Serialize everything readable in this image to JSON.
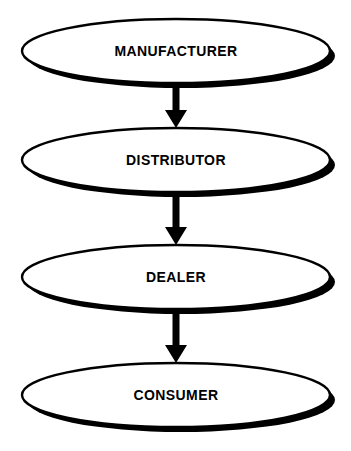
{
  "diagram": {
    "type": "flowchart",
    "orientation": "vertical-top-down",
    "background_color": "#ffffff",
    "shape_fill_color": "#ffffff",
    "shape_outline_color": "#000000",
    "shadow_color": "#000000",
    "text_color": "#000000",
    "nodes": [
      {
        "id": "manufacturer",
        "label": "MANUFACTURER",
        "shape": "ellipse",
        "cx": 176,
        "cy": 51,
        "rx": 154,
        "ry": 32
      },
      {
        "id": "distributor",
        "label": "DISTRIBUTOR",
        "shape": "ellipse",
        "cx": 176,
        "cy": 160,
        "rx": 154,
        "ry": 32
      },
      {
        "id": "dealer",
        "label": "DEALER",
        "shape": "ellipse",
        "cx": 176,
        "cy": 277,
        "rx": 154,
        "ry": 32
      },
      {
        "id": "consumer",
        "label": "CONSUMER",
        "shape": "ellipse",
        "cx": 176,
        "cy": 395,
        "rx": 154,
        "ry": 32
      }
    ],
    "connectors": [
      {
        "id": "manufacturer-to-distributor",
        "from": "manufacturer",
        "to": "distributor",
        "style": "solid-block-arrow",
        "direction": "down",
        "x": 176,
        "y_start": 83,
        "y_end": 128
      },
      {
        "id": "distributor-to-dealer",
        "from": "distributor",
        "to": "dealer",
        "style": "solid-block-arrow",
        "direction": "down",
        "x": 176,
        "y_start": 193,
        "y_end": 245
      },
      {
        "id": "dealer-to-consumer",
        "from": "dealer",
        "to": "consumer",
        "style": "solid-block-arrow",
        "direction": "down",
        "x": 176,
        "y_start": 310,
        "y_end": 363
      }
    ]
  }
}
